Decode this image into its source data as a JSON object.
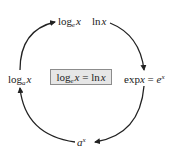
{
  "diagram": {
    "type": "cycle",
    "nodes": [
      {
        "id": "top-left",
        "func": "log",
        "base": "e",
        "arg": "x"
      },
      {
        "id": "top-right",
        "func": "ln",
        "arg": "x"
      },
      {
        "id": "right",
        "func": "exp",
        "arg": "x",
        "eq": "=",
        "rhs_base": "e",
        "rhs_exp": "x"
      },
      {
        "id": "bottom",
        "base": "a",
        "exp": "x"
      },
      {
        "id": "left",
        "func": "log",
        "base": "a",
        "arg": "x"
      }
    ],
    "center": {
      "func": "log",
      "base": "e",
      "arg": "x",
      "eq": "=",
      "rhs_func": "ln",
      "rhs_arg": "x"
    },
    "edges": [
      {
        "from": "top-right",
        "to": "right",
        "direction": "clockwise"
      },
      {
        "from": "right",
        "to": "bottom",
        "direction": "clockwise"
      },
      {
        "from": "bottom",
        "to": "left",
        "direction": "clockwise"
      },
      {
        "from": "left",
        "to": "top-left",
        "direction": "clockwise"
      }
    ],
    "colors": {
      "stroke": "#222222",
      "box_fill": "#e6e6e6",
      "box_border": "#8c8c8c"
    }
  }
}
